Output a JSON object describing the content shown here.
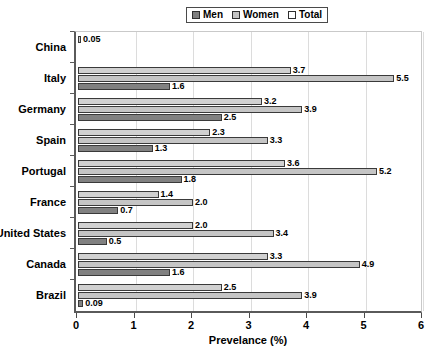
{
  "chart_data": {
    "type": "bar",
    "orientation": "horizontal",
    "title": "",
    "xlabel": "Prevelance (%)",
    "ylabel": "",
    "xlim": [
      0,
      6
    ],
    "xticks": [
      0,
      1,
      2,
      3,
      4,
      5,
      6
    ],
    "xtick_labels": [
      "0",
      "1",
      "2",
      "3",
      "4",
      "5",
      "6"
    ],
    "grid": true,
    "grid_axis": "x",
    "legend_position": "top-center",
    "categories": [
      "China",
      "Italy",
      "Germany",
      "Spain",
      "Portugal",
      "France",
      "United States",
      "Canada",
      "Brazil"
    ],
    "series": [
      {
        "name": "Men",
        "color": "#818181",
        "pattern": "solid-dark-gray",
        "values": [
          null,
          1.6,
          2.5,
          1.3,
          1.8,
          0.7,
          0.5,
          1.6,
          0.09
        ],
        "labels": [
          "",
          "1.6",
          "2.5",
          "1.3",
          "1.8",
          "0.7",
          "0.5",
          "1.6",
          "0.09"
        ]
      },
      {
        "name": "Women",
        "color": "#c5c5c5",
        "pattern": "solid-light-gray",
        "values": [
          null,
          5.5,
          3.9,
          3.3,
          5.2,
          2.0,
          3.4,
          4.9,
          3.9
        ],
        "labels": [
          "",
          "5.5",
          "3.9",
          "3.3",
          "5.2",
          "2.0",
          "3.4",
          "4.9",
          "3.9"
        ]
      },
      {
        "name": "Total",
        "color": "#ffffff",
        "pattern": "dotted-white",
        "values": [
          0.05,
          3.7,
          3.2,
          2.3,
          3.6,
          1.4,
          2.0,
          3.3,
          2.5
        ],
        "labels": [
          "0.05",
          "3.7",
          "3.2",
          "2.3",
          "3.6",
          "1.4",
          "2.0",
          "3.3",
          "2.5"
        ]
      }
    ]
  },
  "legend": {
    "items": [
      {
        "label": "Men",
        "swatch": "men"
      },
      {
        "label": "Women",
        "swatch": "women"
      },
      {
        "label": "Total",
        "swatch": "total"
      }
    ]
  }
}
